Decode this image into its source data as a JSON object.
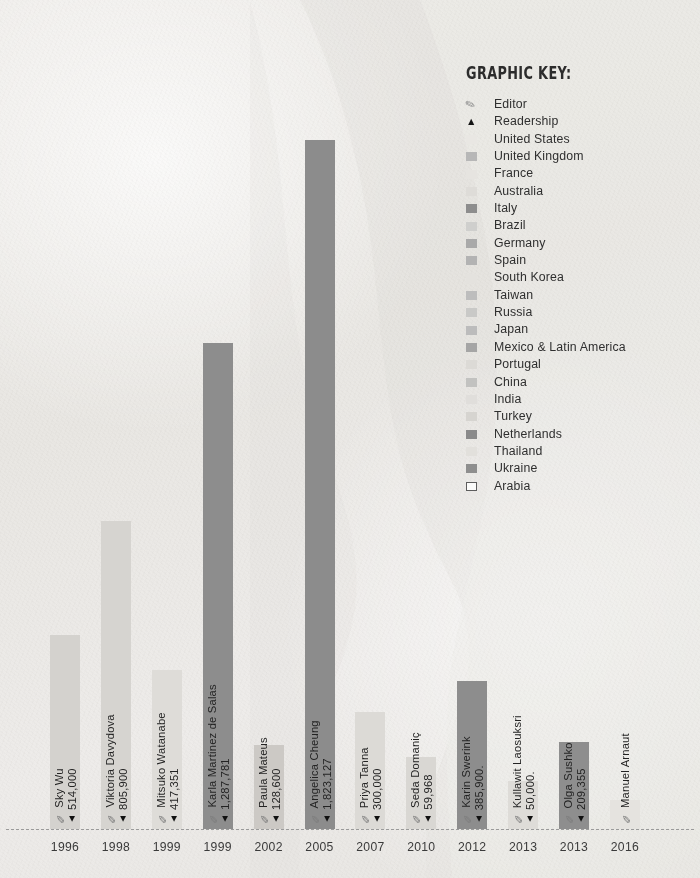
{
  "legend": {
    "title": "GRAPHIC KEY:",
    "items": [
      {
        "label": "Editor",
        "marker": "clip-icon",
        "color": "#8b8b8b"
      },
      {
        "label": "Readership",
        "marker": "triangle-icon",
        "color": "#141414"
      },
      {
        "label": "United States",
        "marker": "swatch",
        "color": "#e9e7e3"
      },
      {
        "label": "United Kingdom",
        "marker": "swatch",
        "color": "#b7b7b7"
      },
      {
        "label": "France",
        "marker": "swatch",
        "color": "#e6e4e0"
      },
      {
        "label": "Australia",
        "marker": "swatch",
        "color": "#dedcd8"
      },
      {
        "label": "Italy",
        "marker": "swatch",
        "color": "#8d8d8d"
      },
      {
        "label": "Brazil",
        "marker": "swatch",
        "color": "#cfcfcd"
      },
      {
        "label": "Germany",
        "marker": "swatch",
        "color": "#a9a9a9"
      },
      {
        "label": "Spain",
        "marker": "swatch",
        "color": "#b3b3b3"
      },
      {
        "label": "South Korea",
        "marker": "swatch",
        "color": "#e4e2de"
      },
      {
        "label": "Taiwan",
        "marker": "swatch",
        "color": "#bdbdbd"
      },
      {
        "label": "Russia",
        "marker": "swatch",
        "color": "#c9c9c7"
      },
      {
        "label": "Japan",
        "marker": "swatch",
        "color": "#bcbcbc"
      },
      {
        "label": "Mexico & Latin America",
        "marker": "swatch",
        "color": "#a5a5a5"
      },
      {
        "label": "Portugal",
        "marker": "swatch",
        "color": "#dcdad6"
      },
      {
        "label": "China",
        "marker": "swatch",
        "color": "#c2c2c0"
      },
      {
        "label": "India",
        "marker": "swatch",
        "color": "#e0dedb"
      },
      {
        "label": "Turkey",
        "marker": "swatch",
        "color": "#d6d4d0"
      },
      {
        "label": "Netherlands",
        "marker": "swatch",
        "color": "#8a8a8a"
      },
      {
        "label": "Thailand",
        "marker": "swatch",
        "color": "#e2e0dc"
      },
      {
        "label": "Ukraine",
        "marker": "swatch",
        "color": "#8e8e8e"
      },
      {
        "label": "Arabia",
        "marker": "swatch-outline",
        "color": "#fbfbfa"
      }
    ]
  },
  "chart_data": {
    "type": "bar",
    "title": "",
    "xlabel": "",
    "ylabel": "",
    "grid": false,
    "legend_position": "top-right",
    "categories": [
      "1996",
      "1998",
      "1999",
      "1999",
      "2002",
      "2005",
      "2007",
      "2010",
      "2012",
      "2013",
      "2013",
      "2016"
    ],
    "values": [
      514000,
      805900,
      417351,
      1287781,
      128600,
      1823127,
      300000,
      59968,
      385900,
      50000,
      209355,
      null
    ],
    "value_labels": [
      "514,000",
      "805,900",
      "417,351",
      "1,287,781",
      "128,600",
      "1,823,127",
      "300,000",
      "59,968",
      "385,900.",
      "50,000.",
      "209,355",
      ""
    ],
    "editors": [
      "Sky Wu",
      "Viktoria Davydova",
      "Mitsuko Watanabe",
      "Karla Martinez de Salas",
      "Paula Mateus",
      "Angelica Cheung",
      "Priya Tanna",
      "Seda Domaniç",
      "Karin Swerink",
      "Kullawit Laosuksri",
      "Olga Sushko",
      "Manuel Arnaut"
    ],
    "bar_colors": [
      "#d4d2ce",
      "#d6d4d0",
      "#dedcd8",
      "#8d8d8d",
      "#ccc9c5",
      "#8c8c8c",
      "#dcdad6",
      "#d9d7d3",
      "#8d8d8d",
      "#dedcd8",
      "#8e8e8e",
      "#e5e3df"
    ],
    "bar_pixel_tops": [
      635,
      521,
      670,
      343,
      745,
      140,
      712,
      757,
      681,
      781,
      742,
      800
    ],
    "baseline_y": 829,
    "ylim": [
      0,
      1823127
    ]
  }
}
